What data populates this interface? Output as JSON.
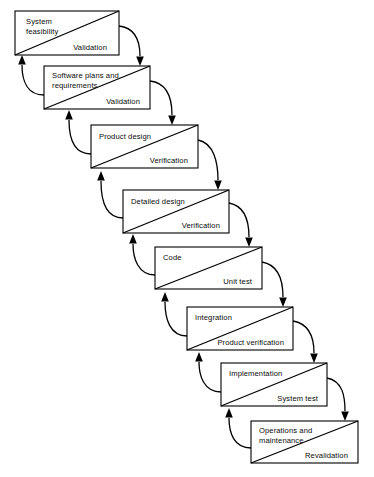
{
  "diagram": {
    "type": "flow-diagram",
    "stroke_color": "#000000",
    "background_color": "#ffffff",
    "stages": [
      {
        "index": 1,
        "phase": "System",
        "phase_line2": "feasibility",
        "verification": "Validation",
        "box": {
          "x": 15,
          "y": 11,
          "w": 104,
          "h": 44
        }
      },
      {
        "index": 2,
        "phase": "Software plans and",
        "phase_line2": "requirements",
        "verification": "Validation",
        "box": {
          "x": 44,
          "y": 66,
          "w": 106,
          "h": 43
        }
      },
      {
        "index": 3,
        "phase": "Product design",
        "phase_line2": "",
        "verification": "Verification",
        "box": {
          "x": 91,
          "y": 125,
          "w": 107,
          "h": 43
        }
      },
      {
        "index": 4,
        "phase": "Detailed design",
        "phase_line2": "",
        "verification": "Verification",
        "box": {
          "x": 123,
          "y": 190,
          "w": 106,
          "h": 43
        }
      },
      {
        "index": 5,
        "phase": "Code",
        "phase_line2": "",
        "verification": "Unit test",
        "box": {
          "x": 155,
          "y": 247,
          "w": 107,
          "h": 42
        }
      },
      {
        "index": 6,
        "phase": "Integration",
        "phase_line2": "",
        "verification": "Product verification",
        "box": {
          "x": 187,
          "y": 307,
          "w": 106,
          "h": 43
        }
      },
      {
        "index": 7,
        "phase": "Implementation",
        "phase_line2": "",
        "verification": "System test",
        "box": {
          "x": 221,
          "y": 363,
          "w": 106,
          "h": 43
        }
      },
      {
        "index": 8,
        "phase": "Operations and",
        "phase_line2": "maintenance",
        "verification": "Revalidation",
        "box": {
          "x": 251,
          "y": 421,
          "w": 107,
          "h": 42
        }
      }
    ]
  }
}
